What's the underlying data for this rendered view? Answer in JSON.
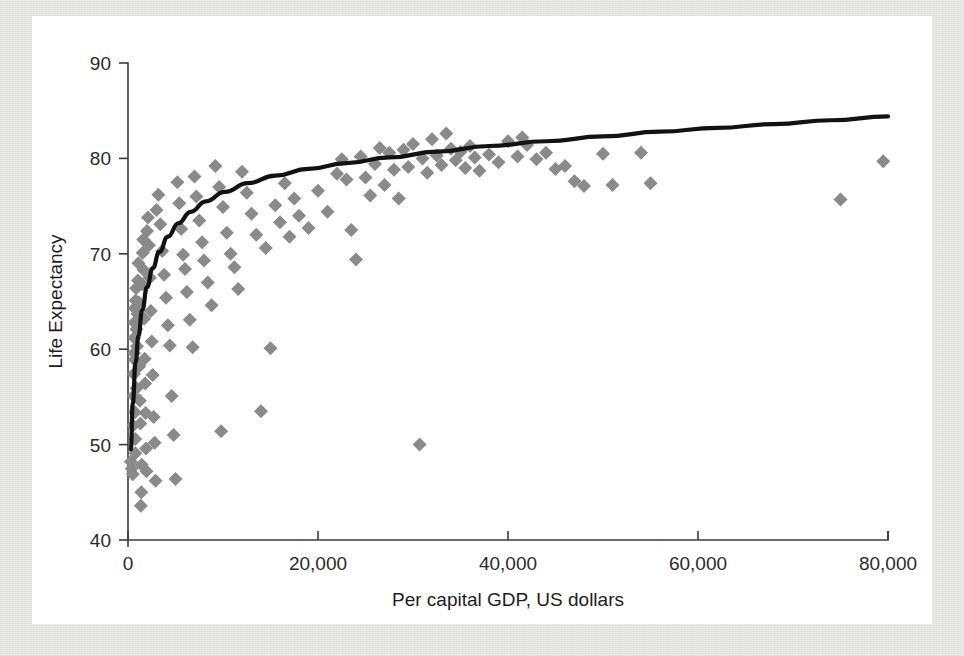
{
  "figure": {
    "background_color": "#ffffff",
    "frame_color": "#e9e9e7",
    "marker_color": "#8a8a8a",
    "trend_color": "#121212",
    "axis_color": "#3b3b3b"
  },
  "chart_data": {
    "type": "scatter",
    "title": "",
    "xlabel": "Per capital GDP, US dollars",
    "ylabel": "Life Expectancy",
    "xlim": [
      0,
      80000
    ],
    "ylim": [
      40,
      90
    ],
    "grid": false,
    "legend": "none",
    "xticks": [
      0,
      20000,
      40000,
      60000,
      80000
    ],
    "xtick_labels": [
      "0",
      "20,000",
      "40,000",
      "60,000",
      "80,000"
    ],
    "yticks": [
      40,
      50,
      60,
      70,
      80,
      90
    ],
    "ytick_labels": [
      "40",
      "50",
      "60",
      "70",
      "80",
      "90"
    ],
    "marker": "diamond",
    "marker_size": 14,
    "series": [
      {
        "name": "Countries",
        "points": [
          [
            300,
            48.2
          ],
          [
            400,
            47.5
          ],
          [
            500,
            46.9
          ],
          [
            550,
            52.0
          ],
          [
            600,
            55.1
          ],
          [
            620,
            57.4
          ],
          [
            640,
            59.6
          ],
          [
            660,
            61.2
          ],
          [
            680,
            62.8
          ],
          [
            700,
            64.3
          ],
          [
            720,
            58.9
          ],
          [
            740,
            53.4
          ],
          [
            760,
            50.6
          ],
          [
            780,
            49.1
          ],
          [
            800,
            65.1
          ],
          [
            850,
            66.4
          ],
          [
            880,
            62.1
          ],
          [
            900,
            55.9
          ],
          [
            950,
            60.3
          ],
          [
            1000,
            63.7
          ],
          [
            1050,
            67.2
          ],
          [
            1100,
            69.0
          ],
          [
            1150,
            64.9
          ],
          [
            1200,
            58.2
          ],
          [
            1250,
            54.6
          ],
          [
            1300,
            52.2
          ],
          [
            1350,
            43.6
          ],
          [
            1400,
            45.0
          ],
          [
            1450,
            47.9
          ],
          [
            1500,
            66.8
          ],
          [
            1550,
            70.1
          ],
          [
            1600,
            71.5
          ],
          [
            1650,
            68.3
          ],
          [
            1700,
            63.2
          ],
          [
            1750,
            59.0
          ],
          [
            1800,
            56.4
          ],
          [
            1850,
            53.3
          ],
          [
            1900,
            49.6
          ],
          [
            1950,
            47.2
          ],
          [
            2000,
            72.4
          ],
          [
            2100,
            73.8
          ],
          [
            2200,
            70.9
          ],
          [
            2300,
            67.5
          ],
          [
            2400,
            64.0
          ],
          [
            2500,
            60.8
          ],
          [
            2600,
            57.3
          ],
          [
            2700,
            52.9
          ],
          [
            2800,
            50.2
          ],
          [
            2900,
            46.2
          ],
          [
            3000,
            74.6
          ],
          [
            3200,
            76.2
          ],
          [
            3400,
            73.1
          ],
          [
            3600,
            70.3
          ],
          [
            3800,
            67.8
          ],
          [
            4000,
            65.4
          ],
          [
            4200,
            62.5
          ],
          [
            4400,
            60.4
          ],
          [
            4600,
            55.1
          ],
          [
            4800,
            51.0
          ],
          [
            5000,
            46.4
          ],
          [
            5200,
            77.5
          ],
          [
            5400,
            75.3
          ],
          [
            5600,
            72.6
          ],
          [
            5800,
            69.9
          ],
          [
            6000,
            68.4
          ],
          [
            6200,
            66.0
          ],
          [
            6500,
            63.1
          ],
          [
            6800,
            60.2
          ],
          [
            7000,
            78.1
          ],
          [
            7200,
            76.0
          ],
          [
            7500,
            73.5
          ],
          [
            7800,
            71.2
          ],
          [
            8000,
            69.3
          ],
          [
            8400,
            67.0
          ],
          [
            8800,
            64.6
          ],
          [
            9200,
            79.2
          ],
          [
            9600,
            77.0
          ],
          [
            9800,
            51.4
          ],
          [
            10000,
            74.9
          ],
          [
            10400,
            72.2
          ],
          [
            10800,
            70.0
          ],
          [
            11200,
            68.6
          ],
          [
            11600,
            66.3
          ],
          [
            12000,
            78.6
          ],
          [
            12500,
            76.4
          ],
          [
            13000,
            74.2
          ],
          [
            13500,
            72.0
          ],
          [
            14000,
            53.5
          ],
          [
            14500,
            70.6
          ],
          [
            15000,
            60.1
          ],
          [
            15500,
            75.1
          ],
          [
            16000,
            73.3
          ],
          [
            16500,
            77.4
          ],
          [
            17000,
            71.8
          ],
          [
            17500,
            75.8
          ],
          [
            18000,
            74.0
          ],
          [
            19000,
            72.7
          ],
          [
            20000,
            76.6
          ],
          [
            21000,
            74.4
          ],
          [
            22000,
            78.4
          ],
          [
            22500,
            79.9
          ],
          [
            23000,
            77.8
          ],
          [
            23500,
            72.5
          ],
          [
            24000,
            69.4
          ],
          [
            24500,
            80.2
          ],
          [
            25000,
            78.0
          ],
          [
            25500,
            76.1
          ],
          [
            26000,
            79.4
          ],
          [
            26500,
            81.1
          ],
          [
            27000,
            77.2
          ],
          [
            27500,
            80.6
          ],
          [
            28000,
            78.8
          ],
          [
            28500,
            75.8
          ],
          [
            29000,
            80.9
          ],
          [
            29500,
            79.1
          ],
          [
            30000,
            81.5
          ],
          [
            30700,
            50.0
          ],
          [
            31000,
            80.0
          ],
          [
            31500,
            78.5
          ],
          [
            32000,
            82.0
          ],
          [
            32500,
            80.3
          ],
          [
            33000,
            79.3
          ],
          [
            33500,
            82.6
          ],
          [
            34000,
            81.0
          ],
          [
            34500,
            79.8
          ],
          [
            35000,
            80.7
          ],
          [
            35500,
            79.0
          ],
          [
            36000,
            81.3
          ],
          [
            36500,
            80.1
          ],
          [
            37000,
            78.7
          ],
          [
            38000,
            80.4
          ],
          [
            39000,
            79.6
          ],
          [
            40000,
            81.8
          ],
          [
            41000,
            80.2
          ],
          [
            41500,
            82.2
          ],
          [
            42000,
            81.4
          ],
          [
            43000,
            79.9
          ],
          [
            44000,
            80.6
          ],
          [
            45000,
            78.9
          ],
          [
            46000,
            79.2
          ],
          [
            47000,
            77.6
          ],
          [
            48000,
            77.1
          ],
          [
            50000,
            80.5
          ],
          [
            51000,
            77.2
          ],
          [
            54000,
            80.6
          ],
          [
            55000,
            77.4
          ],
          [
            75000,
            75.7
          ],
          [
            79500,
            79.7
          ]
        ]
      }
    ],
    "trend": {
      "name": "Logarithmic fit",
      "points": [
        [
          300,
          49.5
        ],
        [
          500,
          54.3
        ],
        [
          800,
          58.6
        ],
        [
          1100,
          61.4
        ],
        [
          1500,
          64.1
        ],
        [
          2000,
          66.5
        ],
        [
          2600,
          68.5
        ],
        [
          3300,
          70.2
        ],
        [
          4200,
          71.8
        ],
        [
          5300,
          73.2
        ],
        [
          6600,
          74.4
        ],
        [
          8200,
          75.5
        ],
        [
          10200,
          76.5
        ],
        [
          12600,
          77.4
        ],
        [
          15500,
          78.2
        ],
        [
          19000,
          78.9
        ],
        [
          23000,
          79.5
        ],
        [
          27500,
          80.1
        ],
        [
          32500,
          80.7
        ],
        [
          38000,
          81.3
        ],
        [
          44000,
          81.8
        ],
        [
          50000,
          82.3
        ],
        [
          56000,
          82.8
        ],
        [
          62000,
          83.2
        ],
        [
          68000,
          83.6
        ],
        [
          74000,
          84.0
        ],
        [
          80000,
          84.4
        ]
      ]
    }
  }
}
